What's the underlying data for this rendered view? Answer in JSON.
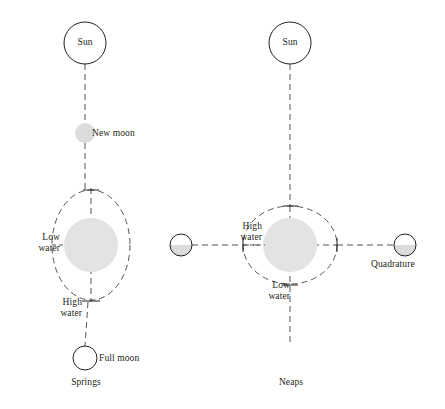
{
  "figure": {
    "title": "",
    "type": "astronomical-tide-diagram",
    "background_color": "#ffffff",
    "ink_color": "#231f20",
    "earth_fill": "#e3e3e3",
    "moon_fill": "#dcdcdc",
    "dash_color": "#555555",
    "outline_color": "#231f20"
  },
  "panels": [
    {
      "id": "springs",
      "caption": "Springs",
      "sun": {
        "label": "Sun",
        "fill": "#ffffff",
        "cx": 85,
        "cy": 43,
        "r": 21
      },
      "bodies": [
        {
          "name": "new-moon",
          "label": "New moon",
          "fill": "#dcdcdc",
          "outline": false,
          "cx": 85,
          "cy": 133,
          "r": 10,
          "label_side": "right"
        },
        {
          "name": "full-moon",
          "label": "Full moon",
          "fill": "#ffffff",
          "outline": true,
          "cx": 85,
          "cy": 358,
          "r": 12,
          "label_side": "right"
        }
      ],
      "earth": {
        "name": "earth",
        "fill": "#e3e3e3",
        "cx": 91,
        "cy": 245,
        "r": 27
      },
      "tidal_bulge": {
        "name": "tidal-ellipse",
        "cx": 91,
        "cy": 245,
        "rx": 39,
        "ry": 55,
        "orientation": "vertical"
      },
      "tide_labels": [
        {
          "name": "low-water",
          "text_lines": [
            "Low",
            "water"
          ],
          "position": "left"
        },
        {
          "name": "high-water",
          "text_lines": [
            "High",
            "water"
          ],
          "position": "bottom-left"
        }
      ]
    },
    {
      "id": "neaps",
      "caption": "Neaps",
      "sun": {
        "label": "Sun",
        "fill": "#ffffff",
        "cx": 290,
        "cy": 43,
        "r": 21
      },
      "bodies": [
        {
          "name": "quadrature-moon-left",
          "label": "",
          "fill": "#dcdcdc",
          "outline": true,
          "half_shaded": true,
          "cx": 181,
          "cy": 245,
          "r": 11,
          "label_side": "none"
        },
        {
          "name": "quadrature-moon-right",
          "label": "Quadrature",
          "fill": "#dcdcdc",
          "outline": true,
          "half_shaded": true,
          "cx": 405,
          "cy": 245,
          "r": 11,
          "label_side": "below"
        }
      ],
      "earth": {
        "name": "earth",
        "fill": "#e3e3e3",
        "cx": 290,
        "cy": 245,
        "r": 27
      },
      "tidal_bulge": {
        "name": "tidal-ellipse",
        "cx": 290,
        "cy": 245,
        "rx": 47,
        "ry": 39,
        "orientation": "horizontal"
      },
      "tide_labels": [
        {
          "name": "high-water",
          "text_lines": [
            "High",
            "water"
          ],
          "position": "left"
        },
        {
          "name": "low-water",
          "text_lines": [
            "Low",
            "water"
          ],
          "position": "bottom"
        }
      ]
    }
  ],
  "text": {
    "sun_left": "Sun",
    "sun_right": "Sun",
    "new_moon": "New moon",
    "full_moon": "Full moon",
    "quadrature": "Quadrature",
    "low_water_left_line1": "Low",
    "low_water_left_line2": "water",
    "high_water_left_line1": "High",
    "high_water_left_line2": "water",
    "high_water_right_line1": "High",
    "high_water_right_line2": "water",
    "low_water_right_line1": "Low",
    "low_water_right_line2": "water",
    "caption_left": "Springs",
    "caption_right": "Neaps"
  }
}
